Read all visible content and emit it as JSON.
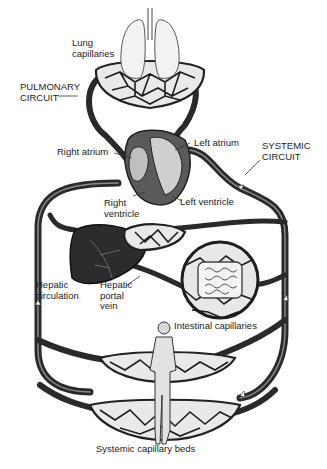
{
  "figure": {
    "colors": {
      "vessel": "#2a2a2a",
      "background": "#ffffff",
      "text": "#222222",
      "organ_fill": "#e6e6e6",
      "liver": "#2c2c2c"
    }
  },
  "labels": {
    "lung_capillaries": "Lung\ncapillaries",
    "pulmonary_circuit": "PULMONARY\nCIRCUIT",
    "right_atrium": "Right atrium",
    "left_atrium": "Left atrium",
    "systemic_circuit": "SYSTEMIC\nCIRCUIT",
    "right_ventricle": "Right\nventricle",
    "left_ventricle": "Left ventricle",
    "hepatic_circulation": "Hepatic\ncirculation",
    "hepatic_portal_vein": "Hepatic\nportal\nvein",
    "intestinal_capillaries": "Intestinal capillaries",
    "systemic_capillary_beds": "Systemic capillary beds"
  }
}
